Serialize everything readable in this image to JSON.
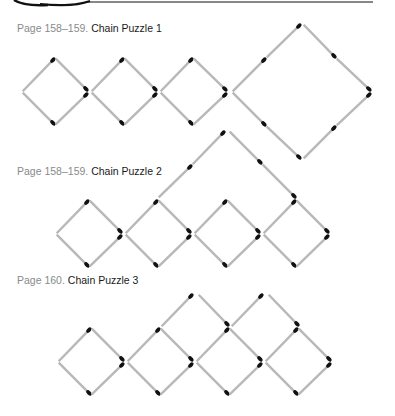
{
  "header": {
    "rule_color": "#111111"
  },
  "puzzles": [
    {
      "page": "Page 158–159.",
      "title": "Chain Puzzle 1",
      "caption_y": 22
    },
    {
      "page": "Page 158–159.",
      "title": "Chain Puzzle 2",
      "caption_y": 165
    },
    {
      "page": "Page 160.",
      "title": "Chain Puzzle 3",
      "caption_y": 274
    }
  ],
  "style": {
    "stick_color": "#b8b8b8",
    "head_color": "#111111"
  },
  "sticks": [
    [
      22,
      92,
      55,
      58
    ],
    [
      55,
      58,
      88,
      91
    ],
    [
      22,
      92,
      55,
      125
    ],
    [
      55,
      125,
      88,
      93
    ],
    [
      91,
      92,
      124,
      58
    ],
    [
      124,
      58,
      157,
      91
    ],
    [
      91,
      92,
      124,
      125
    ],
    [
      124,
      125,
      157,
      93
    ],
    [
      160,
      92,
      193,
      58
    ],
    [
      193,
      58,
      227,
      91
    ],
    [
      160,
      92,
      193,
      125
    ],
    [
      193,
      125,
      227,
      93
    ],
    [
      232,
      92,
      266,
      58
    ],
    [
      266,
      58,
      301,
      24
    ],
    [
      303,
      24,
      336,
      58
    ],
    [
      336,
      58,
      371,
      91
    ],
    [
      232,
      92,
      266,
      126
    ],
    [
      266,
      126,
      301,
      159
    ],
    [
      303,
      159,
      336,
      126
    ],
    [
      336,
      126,
      371,
      93
    ],
    [
      56,
      234,
      89,
      200
    ],
    [
      89,
      200,
      122,
      233
    ],
    [
      56,
      234,
      89,
      267
    ],
    [
      89,
      267,
      122,
      235
    ],
    [
      125,
      234,
      158,
      200
    ],
    [
      158,
      200,
      191,
      233
    ],
    [
      125,
      234,
      158,
      267
    ],
    [
      158,
      267,
      191,
      235
    ],
    [
      194,
      234,
      227,
      200
    ],
    [
      227,
      200,
      260,
      233
    ],
    [
      194,
      234,
      227,
      267
    ],
    [
      227,
      267,
      260,
      235
    ],
    [
      263,
      234,
      296,
      200
    ],
    [
      296,
      200,
      329,
      233
    ],
    [
      263,
      234,
      296,
      267
    ],
    [
      296,
      267,
      329,
      235
    ],
    [
      158,
      198,
      192,
      165
    ],
    [
      192,
      165,
      225,
      131
    ],
    [
      229,
      131,
      262,
      164
    ],
    [
      262,
      164,
      296,
      198
    ],
    [
      58,
      362,
      91,
      328
    ],
    [
      91,
      328,
      124,
      361
    ],
    [
      58,
      362,
      91,
      395
    ],
    [
      91,
      395,
      124,
      363
    ],
    [
      127,
      362,
      160,
      328
    ],
    [
      160,
      328,
      193,
      361
    ],
    [
      127,
      362,
      160,
      395
    ],
    [
      160,
      395,
      193,
      363
    ],
    [
      196,
      362,
      229,
      328
    ],
    [
      229,
      328,
      262,
      361
    ],
    [
      196,
      362,
      229,
      395
    ],
    [
      229,
      395,
      262,
      363
    ],
    [
      265,
      362,
      298,
      328
    ],
    [
      298,
      328,
      331,
      361
    ],
    [
      265,
      362,
      298,
      395
    ],
    [
      298,
      395,
      331,
      363
    ],
    [
      161,
      327,
      193,
      294
    ],
    [
      198,
      294,
      229,
      326
    ],
    [
      231,
      327,
      263,
      294
    ],
    [
      268,
      294,
      299,
      326
    ]
  ]
}
